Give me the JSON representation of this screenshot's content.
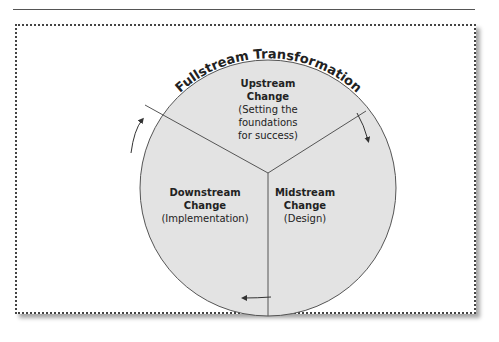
{
  "diagram": {
    "title": "Fullstream Transformation",
    "segments": [
      {
        "id": "upstream",
        "title_line1": "Upstream",
        "title_line2": "Change",
        "desc_lines": [
          "(Setting the",
          "foundations",
          "for success)"
        ]
      },
      {
        "id": "midstream",
        "title_line1": "Midstream",
        "title_line2": "Change",
        "desc_lines": [
          "(Design)"
        ]
      },
      {
        "id": "downstream",
        "title_line1": "Downstream",
        "title_line2": "Change",
        "desc_lines": [
          "(Implementation)"
        ]
      }
    ],
    "flow_direction": "clockwise",
    "colors": {
      "segment_fill": "#e3e3e3",
      "outline": "#555555",
      "frame_border": "#444444"
    }
  }
}
